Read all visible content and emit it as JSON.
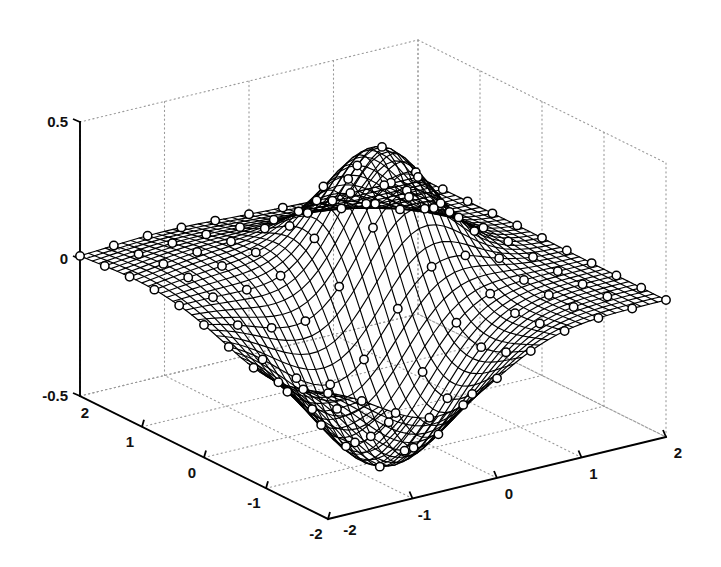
{
  "figure": {
    "title": "",
    "background_color": "#ffffff",
    "line_color": "#000000",
    "grid_color": "#9a9a9a",
    "marker_fill": "#ffffff"
  },
  "axes": {
    "z": {
      "label": "",
      "ticks": [
        "0.5",
        "0",
        "-0.5"
      ],
      "tick_values": [
        0.5,
        0,
        -0.5
      ],
      "range": [
        -0.5,
        0.5
      ]
    },
    "y": {
      "label": "",
      "ticks": [
        "2",
        "1",
        "0",
        "-1",
        "-2"
      ],
      "tick_values": [
        2,
        1,
        0,
        -1,
        -2
      ],
      "range": [
        -2,
        2
      ]
    },
    "x": {
      "label": "",
      "ticks": [
        "-2",
        "-1",
        "0",
        "1",
        "2"
      ],
      "tick_values": [
        -2,
        -1,
        0,
        1,
        2
      ],
      "range": [
        -2,
        2
      ]
    }
  },
  "chart_data": {
    "type": "surface",
    "title": "",
    "xlabel": "",
    "ylabel": "",
    "zlabel": "",
    "xlim": [
      -2,
      2
    ],
    "ylim": [
      -2,
      2
    ],
    "zlim": [
      -0.5,
      0.5
    ],
    "xticks": [
      -2,
      -1,
      0,
      1,
      2
    ],
    "yticks": [
      -2,
      -1,
      0,
      1,
      2
    ],
    "zticks": [
      -0.5,
      0,
      0.5
    ],
    "grid": true,
    "legend": "none",
    "view": {
      "azimuth": -37.5,
      "elevation": 30
    },
    "mesh_resolution": {
      "nx": 41,
      "ny": 41
    },
    "marker_resolution": {
      "nx": 11,
      "ny": 11
    },
    "marker_style": "open-circle",
    "surface_description": "Smooth two-lobed surface: a positive peak of about +0.42 near (x=0.35, y=0.35) and a negative trough of about -0.50 near (x=-0.7, y=-1.1), flattening to near 0 at the domain edges.",
    "peak": {
      "x": 0.35,
      "y": 0.35,
      "z": 0.42
    },
    "trough": {
      "x": -0.7,
      "y": -1.1,
      "z": -0.5
    },
    "function": "z = 0.42*exp(-((x-0.35)^2+(y-0.35)^2)/0.55) - 0.5*exp(-((x+0.7)^2+(y+1.1)^2)/1.0) + 0.06*exp(-((x+1.0)^2+(y-1.0)^2)/1.2)",
    "sample_grid_x": [
      -2,
      -1.6,
      -1.2,
      -0.8,
      -0.4,
      0,
      0.4,
      0.8,
      1.2,
      1.6,
      2
    ],
    "sample_grid_y": [
      -2,
      -1.6,
      -1.2,
      -0.8,
      -0.4,
      0,
      0.4,
      0.8,
      1.2,
      1.6,
      2
    ],
    "z_matrix": [
      [
        -0.03,
        -0.06,
        -0.09,
        -0.11,
        -0.1,
        -0.07,
        -0.04,
        -0.02,
        -0.01,
        0.0,
        0.0
      ],
      [
        -0.06,
        -0.13,
        -0.21,
        -0.26,
        -0.24,
        -0.17,
        -0.1,
        -0.04,
        -0.01,
        0.0,
        0.0
      ],
      [
        -0.1,
        -0.22,
        -0.36,
        -0.44,
        -0.41,
        -0.29,
        -0.16,
        -0.06,
        -0.01,
        0.0,
        0.0
      ],
      [
        -0.11,
        -0.26,
        -0.44,
        -0.5,
        -0.44,
        -0.28,
        -0.11,
        0.01,
        0.04,
        0.03,
        0.01
      ],
      [
        -0.09,
        -0.22,
        -0.38,
        -0.43,
        -0.31,
        -0.08,
        0.14,
        0.25,
        0.21,
        0.1,
        0.03
      ],
      [
        -0.05,
        -0.13,
        -0.24,
        -0.25,
        -0.05,
        0.24,
        0.4,
        0.42,
        0.3,
        0.14,
        0.04
      ],
      [
        -0.02,
        -0.05,
        -0.1,
        -0.07,
        0.14,
        0.38,
        0.42,
        0.36,
        0.23,
        0.1,
        0.03
      ],
      [
        0.0,
        0.0,
        0.0,
        0.05,
        0.2,
        0.33,
        0.32,
        0.23,
        0.13,
        0.05,
        0.01
      ],
      [
        0.02,
        0.03,
        0.05,
        0.09,
        0.16,
        0.2,
        0.17,
        0.11,
        0.05,
        0.02,
        0.0
      ],
      [
        0.02,
        0.04,
        0.05,
        0.07,
        0.09,
        0.09,
        0.07,
        0.04,
        0.02,
        0.0,
        0.0
      ],
      [
        0.02,
        0.02,
        0.03,
        0.03,
        0.04,
        0.03,
        0.02,
        0.01,
        0.0,
        0.0,
        0.0
      ]
    ]
  }
}
